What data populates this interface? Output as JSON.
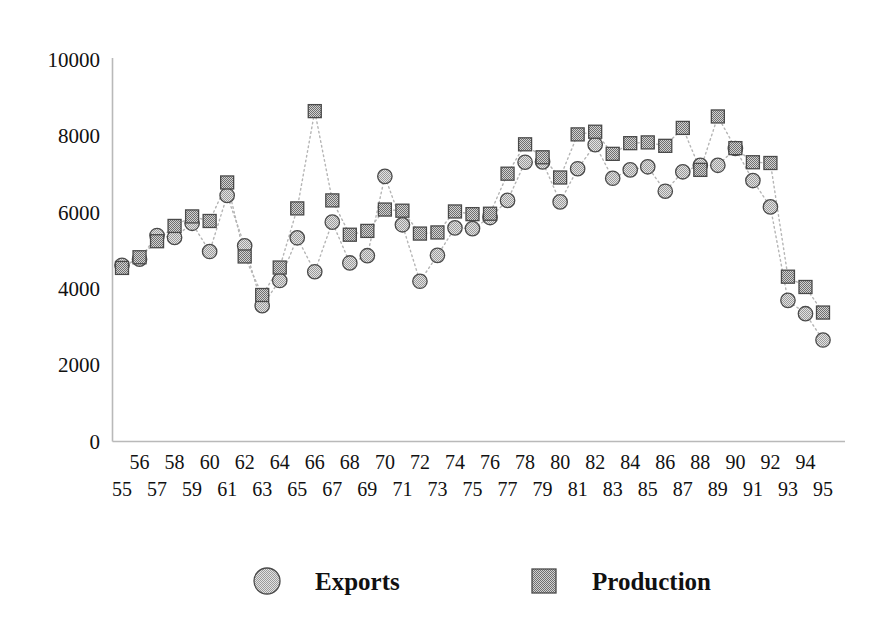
{
  "chart_data": {
    "type": "scatter",
    "title": "",
    "subtitle": "",
    "xlabel": "",
    "ylabel": "",
    "ylim": [
      0,
      10000
    ],
    "xlim": [
      55,
      95
    ],
    "grid": false,
    "legend_position": "bottom",
    "yticks": [
      0,
      2000,
      4000,
      6000,
      8000,
      10000
    ],
    "ytick_labels": [
      "0",
      "2000",
      "4000",
      "6000",
      "8000",
      "10000"
    ],
    "categories": [
      "55",
      "56",
      "57",
      "58",
      "59",
      "60",
      "61",
      "62",
      "63",
      "64",
      "65",
      "66",
      "67",
      "68",
      "69",
      "70",
      "71",
      "72",
      "73",
      "74",
      "75",
      "76",
      "77",
      "78",
      "79",
      "80",
      "81",
      "82",
      "83",
      "84",
      "85",
      "86",
      "87",
      "88",
      "89",
      "90",
      "91",
      "92",
      "93",
      "94",
      "95"
    ],
    "xtick_labels_top": [
      "56",
      "58",
      "60",
      "62",
      "64",
      "66",
      "68",
      "70",
      "72",
      "74",
      "76",
      "78",
      "80",
      "82",
      "84",
      "86",
      "88",
      "90",
      "92",
      "94"
    ],
    "xtick_labels_bottom": [
      "55",
      "57",
      "59",
      "61",
      "63",
      "65",
      "67",
      "69",
      "71",
      "73",
      "75",
      "77",
      "79",
      "81",
      "83",
      "85",
      "87",
      "89",
      "91",
      "93",
      "95"
    ],
    "series": [
      {
        "name": "Exports",
        "marker": "circle",
        "color": "#d0d0d0",
        "values": [
          4620,
          4780,
          5400,
          5350,
          5720,
          4980,
          6450,
          5130,
          3560,
          4220,
          5340,
          4450,
          5750,
          4680,
          4870,
          6950,
          5680,
          4200,
          4880,
          5600,
          5580,
          5870,
          6320,
          7320,
          7330,
          6280,
          7150,
          7780,
          6900,
          7120,
          7200,
          6560,
          7070,
          7240,
          7240,
          7680,
          6840,
          6150,
          3700,
          3350,
          2660
        ]
      },
      {
        "name": "Production",
        "marker": "square",
        "color": "#a8a8a8",
        "values": [
          4550,
          4830,
          5250,
          5650,
          5900,
          5780,
          6790,
          4850,
          3840,
          4560,
          6110,
          8660,
          6320,
          5420,
          5520,
          6080,
          6050,
          5450,
          5480,
          6030,
          5960,
          5970,
          7020,
          7790,
          7450,
          6920,
          8050,
          8120,
          7540,
          7820,
          7840,
          7750,
          8220,
          7120,
          8520,
          7690,
          7320,
          7300,
          4320,
          4050,
          3380
        ]
      }
    ]
  },
  "legend": {
    "items": [
      {
        "label": "Exports",
        "marker": "circle"
      },
      {
        "label": "Production",
        "marker": "square"
      }
    ]
  }
}
